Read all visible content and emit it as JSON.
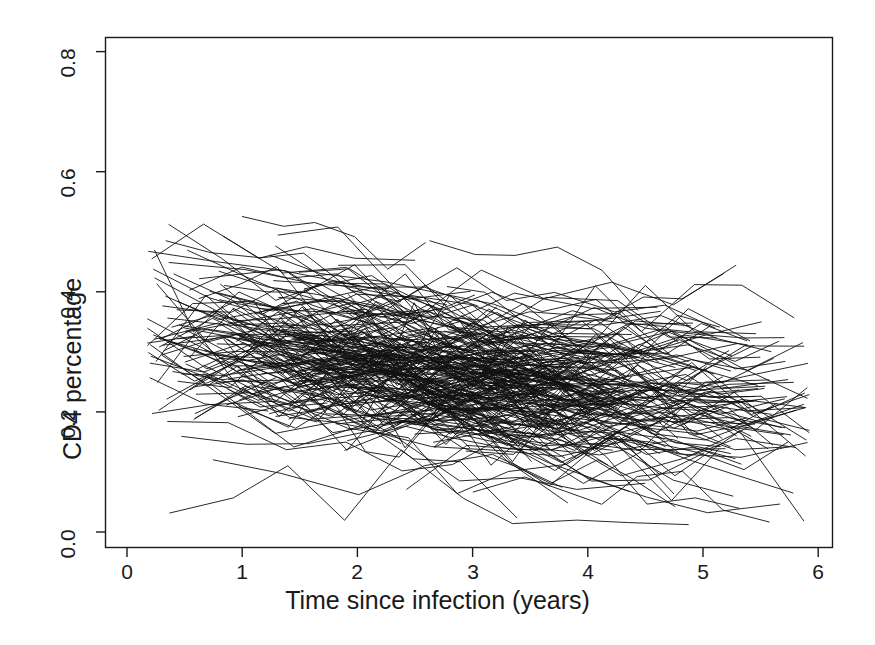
{
  "chart_data": {
    "type": "line",
    "title": "",
    "subtitle": "",
    "xlabel": "Time since infection (years)",
    "ylabel": "CD4 percentage",
    "xlim": [
      -0.12,
      6.2
    ],
    "ylim": [
      -0.03,
      0.84
    ],
    "xticks": [
      0,
      1,
      2,
      3,
      4,
      5,
      6
    ],
    "xtick_labels": [
      "0",
      "1",
      "2",
      "3",
      "4",
      "5",
      "6"
    ],
    "yticks": [
      0.0,
      0.2,
      0.4,
      0.6,
      0.8
    ],
    "ytick_labels": [
      "0.0",
      "0.2",
      "0.4",
      "0.6",
      "0.8"
    ],
    "grid": false,
    "legend": null,
    "annotations": [],
    "line_color": "#111111",
    "line_width": 0.9,
    "background": "#ffffff",
    "frame": true,
    "n_series": 280,
    "x_data_range": [
      0.18,
      5.92
    ],
    "y_data_range": [
      0.01,
      0.63
    ],
    "series_summary": {
      "x_reference": [
        0.2,
        1.0,
        2.0,
        3.0,
        4.0,
        5.0,
        5.9
      ],
      "median": [
        0.335,
        0.315,
        0.285,
        0.255,
        0.235,
        0.225,
        0.215
      ],
      "q25": [
        0.265,
        0.25,
        0.22,
        0.195,
        0.175,
        0.165,
        0.16
      ],
      "q75": [
        0.4,
        0.38,
        0.35,
        0.32,
        0.3,
        0.29,
        0.28
      ],
      "p05": [
        0.15,
        0.13,
        0.1,
        0.08,
        0.065,
        0.055,
        0.04
      ],
      "p95": [
        0.51,
        0.495,
        0.47,
        0.44,
        0.42,
        0.415,
        0.4
      ]
    }
  },
  "axes": {
    "x_title": "Time since infection (years)",
    "y_title": "CD4 percentage"
  }
}
